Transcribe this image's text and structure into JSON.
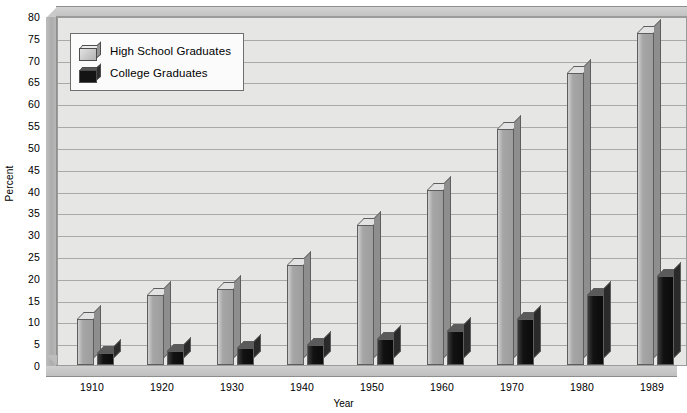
{
  "chart_data": {
    "type": "bar",
    "title": "",
    "xlabel": "Year",
    "ylabel": "Percent",
    "categories": [
      "1910",
      "1920",
      "1930",
      "1940",
      "1950",
      "1960",
      "1970",
      "1980",
      "1989"
    ],
    "series": [
      {
        "name": "High School Graduates",
        "color": "#a6a6a6",
        "values": [
          10.5,
          16.0,
          17.5,
          23.0,
          32.0,
          40.0,
          54.0,
          67.0,
          76.0
        ]
      },
      {
        "name": "College Graduates",
        "color": "#111111",
        "values": [
          2.7,
          3.3,
          3.9,
          4.6,
          6.0,
          7.7,
          10.5,
          16.0,
          20.5
        ]
      }
    ],
    "ylim": [
      0,
      80
    ],
    "ytick_step": 5,
    "yticks": [
      "80",
      "75",
      "70",
      "65",
      "60",
      "55",
      "50",
      "45",
      "40",
      "35",
      "30",
      "25",
      "20",
      "15",
      "10",
      "5",
      "0"
    ],
    "grid": true,
    "legend_position": "top-left",
    "style": "3d-bar"
  },
  "legend": {
    "items": [
      {
        "label": "High School Graduates",
        "swatch": "light-gray-cube"
      },
      {
        "label": "College Graduates",
        "swatch": "black-cube"
      }
    ]
  },
  "colors": {
    "plot_background": "#e6e6e4",
    "gridline": "#a9a9a9",
    "frame": "#c2c2c2",
    "hs_bar": "#a6a6a6",
    "college_bar": "#111111"
  }
}
